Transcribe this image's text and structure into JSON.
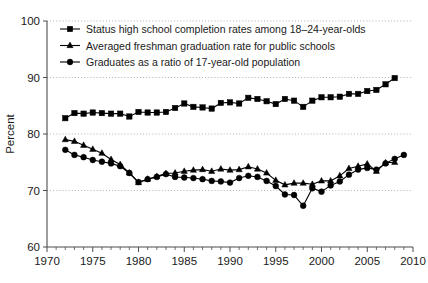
{
  "chart_data": {
    "type": "line",
    "title": "",
    "xlabel": "",
    "ylabel": "Percent",
    "xlim": [
      1970,
      2010
    ],
    "ylim": [
      60,
      100
    ],
    "ytick_values": [
      60,
      70,
      80,
      90,
      100
    ],
    "ytick_labels": [
      "60",
      "70",
      "80",
      "90",
      "100"
    ],
    "xtick_values": [
      1970,
      1975,
      1980,
      1985,
      1990,
      1995,
      2000,
      2005,
      2010
    ],
    "xtick_labels": [
      "1970",
      "1975",
      "1980",
      "1985",
      "1990",
      "1995",
      "2000",
      "2005",
      "2010"
    ],
    "minor_xtick_step": 1,
    "grid": "horizontal-dotted",
    "legend_position": "upper-left-inside",
    "series": [
      {
        "name": "Status high school completion rates among 18–24-year-olds",
        "marker": "square",
        "color": "#000000",
        "x": [
          1972,
          1973,
          1974,
          1975,
          1976,
          1977,
          1978,
          1979,
          1980,
          1981,
          1982,
          1983,
          1984,
          1985,
          1986,
          1987,
          1988,
          1989,
          1990,
          1991,
          1992,
          1993,
          1994,
          1995,
          1996,
          1997,
          1998,
          1999,
          2000,
          2001,
          2002,
          2003,
          2004,
          2005,
          2006,
          2007,
          2008
        ],
        "values": [
          82.8,
          83.7,
          83.6,
          83.8,
          83.7,
          83.6,
          83.6,
          83.1,
          83.9,
          83.8,
          83.8,
          83.9,
          84.6,
          85.4,
          84.8,
          84.7,
          84.5,
          85.5,
          85.6,
          85.4,
          86.4,
          86.2,
          85.8,
          85.3,
          86.2,
          85.9,
          84.8,
          85.9,
          86.5,
          86.5,
          86.6,
          87.1,
          87.1,
          87.6,
          87.8,
          88.8,
          89.9
        ]
      },
      {
        "name": "Averaged freshman graduation rate for public schools",
        "marker": "triangle",
        "color": "#000000",
        "x": [
          1972,
          1973,
          1974,
          1975,
          1976,
          1977,
          1978,
          1979,
          1980,
          1981,
          1982,
          1983,
          1984,
          1985,
          1986,
          1987,
          1988,
          1989,
          1990,
          1991,
          1992,
          1993,
          1994,
          1995,
          1996,
          1997,
          1998,
          1999,
          2000,
          2001,
          2002,
          2003,
          2004,
          2005,
          2006,
          2007,
          2008
        ],
        "values": [
          79.0,
          78.7,
          78.0,
          77.3,
          76.6,
          75.5,
          74.6,
          73.1,
          71.4,
          72.0,
          72.5,
          73.0,
          73.1,
          73.4,
          73.6,
          73.7,
          73.4,
          73.8,
          73.6,
          73.7,
          74.2,
          73.8,
          73.1,
          71.8,
          71.0,
          71.3,
          71.3,
          71.1,
          71.7,
          71.7,
          72.6,
          73.9,
          74.3,
          74.7,
          73.4,
          74.9,
          75.0
        ]
      },
      {
        "name": "Graduates as a ratio of 17-year-old population",
        "marker": "circle",
        "color": "#000000",
        "x": [
          1972,
          1973,
          1974,
          1975,
          1976,
          1977,
          1978,
          1979,
          1980,
          1981,
          1982,
          1983,
          1984,
          1985,
          1986,
          1987,
          1988,
          1989,
          1990,
          1991,
          1992,
          1993,
          1994,
          1995,
          1996,
          1997,
          1998,
          1999,
          2000,
          2001,
          2002,
          2003,
          2004,
          2005,
          2006,
          2007,
          2008,
          2009
        ],
        "values": [
          77.2,
          76.3,
          75.9,
          75.4,
          75.1,
          74.8,
          74.3,
          73.1,
          71.5,
          72.0,
          72.4,
          72.9,
          72.4,
          72.3,
          72.2,
          72.0,
          71.7,
          71.6,
          71.4,
          72.2,
          72.6,
          72.4,
          71.7,
          70.8,
          69.3,
          69.2,
          67.3,
          70.4,
          69.8,
          70.9,
          71.6,
          72.8,
          73.7,
          74.0,
          73.7,
          74.8,
          75.6,
          76.3
        ]
      }
    ]
  },
  "axis": {
    "y_title": "Percent"
  },
  "legend": {
    "items": [
      {
        "label": "Status high school completion rates among 18–24-year-olds",
        "marker": "square"
      },
      {
        "label": "Averaged freshman graduation rate for public schools",
        "marker": "triangle"
      },
      {
        "label": "Graduates as a ratio of 17-year-old population",
        "marker": "circle"
      }
    ]
  }
}
